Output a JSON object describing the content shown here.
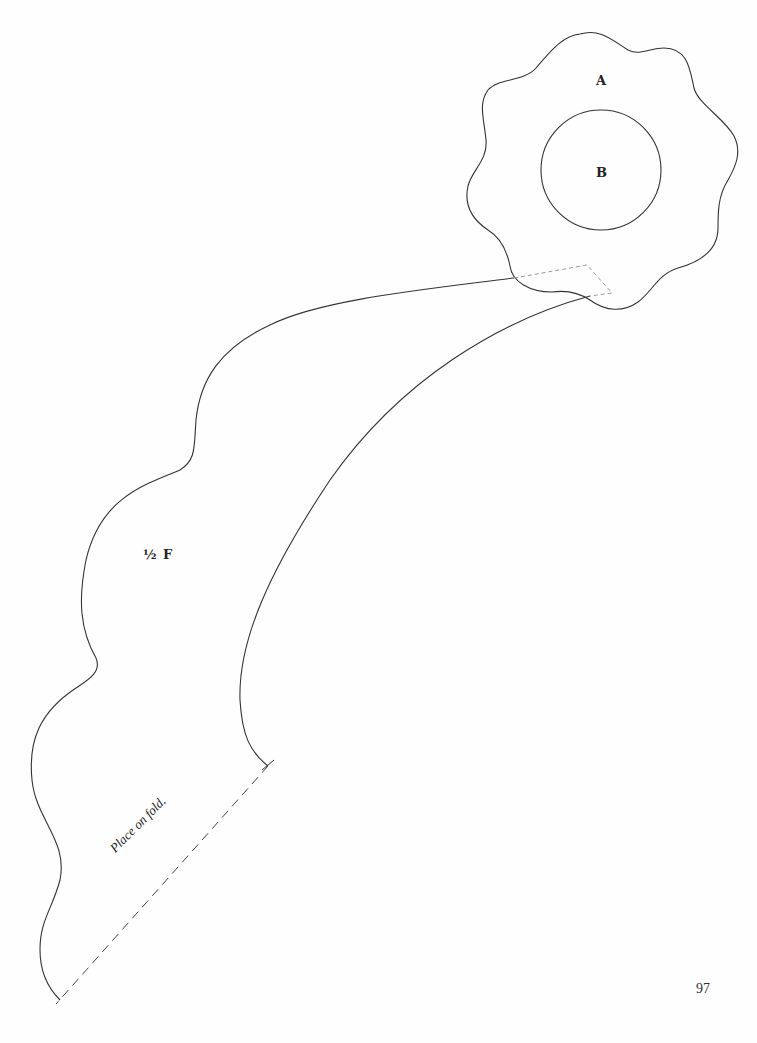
{
  "pattern_pieces": {
    "flower_outer": {
      "label": "A"
    },
    "flower_center": {
      "label": "B"
    },
    "stem": {
      "label": "½ F",
      "fold_instruction": "Place on fold."
    }
  },
  "page": {
    "number": "97"
  },
  "colors": {
    "outline": "#333333",
    "dashed_guide": "#999999",
    "fold_line": "#444444"
  }
}
